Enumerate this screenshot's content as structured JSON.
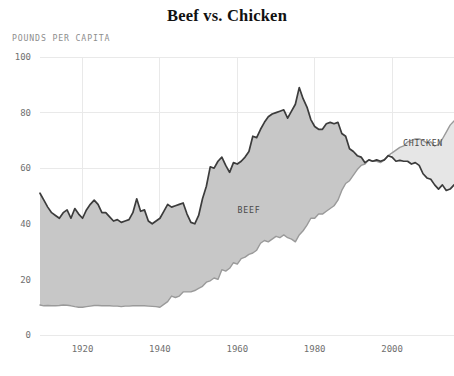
{
  "chart_data": {
    "type": "area",
    "title": "Beef vs. Chicken",
    "subtitle": "",
    "xlabel": "",
    "ylabel": "POUNDS PER CAPITA",
    "ylim": [
      0,
      100
    ],
    "xlim": [
      1909,
      2016
    ],
    "grid": true,
    "legend_position": "inline-annotation",
    "y_ticks": [
      0,
      20,
      40,
      60,
      80,
      100
    ],
    "y_tick_labels": [
      "0",
      "20",
      "40",
      "60",
      "80",
      "100"
    ],
    "x_ticks": [
      1920,
      1940,
      1960,
      1980,
      2000
    ],
    "x_tick_labels": [
      "1920",
      "1940",
      "1960",
      "1980",
      "2000"
    ],
    "annotations": [
      {
        "text": "BEEF",
        "x": 1963,
        "y": 44,
        "color": "#4a4a4a"
      },
      {
        "text": "CHICKEN",
        "x": 2008,
        "y": 68,
        "color": "#4a4a4a"
      }
    ],
    "colors": {
      "beef_fill": "#c7c7c7",
      "beef_stroke": "#3c3c3c",
      "chicken_fill": "#e6e6e6",
      "chicken_stroke": "#9a9a9a",
      "gridline": "#e9e9e9",
      "axis_text": "#6f6f6f",
      "caption_text": "#8d8d8d",
      "title_text": "#111111",
      "background": "#ffffff"
    },
    "x": [
      1909,
      1910,
      1911,
      1912,
      1913,
      1914,
      1915,
      1916,
      1917,
      1918,
      1919,
      1920,
      1921,
      1922,
      1923,
      1924,
      1925,
      1926,
      1927,
      1928,
      1929,
      1930,
      1931,
      1932,
      1933,
      1934,
      1935,
      1936,
      1937,
      1938,
      1939,
      1940,
      1941,
      1942,
      1943,
      1944,
      1945,
      1946,
      1947,
      1948,
      1949,
      1950,
      1951,
      1952,
      1953,
      1954,
      1955,
      1956,
      1957,
      1958,
      1959,
      1960,
      1961,
      1962,
      1963,
      1964,
      1965,
      1966,
      1967,
      1968,
      1969,
      1970,
      1971,
      1972,
      1973,
      1974,
      1975,
      1976,
      1977,
      1978,
      1979,
      1980,
      1981,
      1982,
      1983,
      1984,
      1985,
      1986,
      1987,
      1988,
      1989,
      1990,
      1991,
      1992,
      1993,
      1994,
      1995,
      1996,
      1997,
      1998,
      1999,
      2000,
      2001,
      2002,
      2003,
      2004,
      2005,
      2006,
      2007,
      2008,
      2009,
      2010,
      2011,
      2012,
      2013,
      2014,
      2015,
      2016
    ],
    "series": [
      {
        "name": "BEEF",
        "label": "BEEF",
        "fill": "#c7c7c7",
        "stroke": "#3c3c3c",
        "values": [
          51.0,
          48.5,
          46.0,
          44.0,
          43.0,
          42.0,
          44.0,
          45.0,
          42.0,
          45.5,
          43.5,
          42.0,
          45.0,
          47.0,
          48.5,
          47.0,
          44.0,
          44.0,
          42.5,
          41.0,
          41.5,
          40.5,
          41.0,
          41.5,
          44.0,
          49.0,
          44.5,
          45.0,
          41.0,
          40.0,
          41.0,
          42.0,
          44.5,
          47.0,
          46.0,
          46.5,
          47.0,
          47.5,
          43.5,
          40.5,
          40.0,
          43.0,
          49.0,
          53.5,
          60.5,
          60.0,
          62.5,
          64.0,
          61.0,
          58.5,
          62.0,
          61.5,
          62.5,
          64.0,
          66.0,
          71.5,
          71.0,
          74.0,
          76.5,
          78.5,
          79.5,
          80.0,
          80.5,
          81.0,
          78.0,
          80.5,
          83.0,
          89.0,
          85.0,
          82.0,
          77.5,
          75.0,
          74.0,
          74.0,
          76.0,
          76.5,
          76.0,
          76.5,
          72.5,
          71.5,
          67.0,
          66.0,
          64.5,
          64.0,
          62.0,
          63.0,
          62.5,
          63.0,
          62.5,
          63.0,
          64.5,
          64.0,
          62.5,
          62.8,
          62.5,
          62.5,
          61.5,
          62.0,
          61.0,
          58.0,
          56.5,
          56.0,
          54.0,
          52.5,
          54.0,
          52.0,
          52.5,
          54.0
        ]
      },
      {
        "name": "CHICKEN",
        "label": "CHICKEN",
        "fill": "#e6e6e6",
        "stroke": "#9a9a9a",
        "values": [
          10.8,
          10.5,
          10.6,
          10.5,
          10.5,
          10.6,
          10.8,
          10.7,
          10.5,
          10.2,
          10.0,
          10.0,
          10.2,
          10.4,
          10.6,
          10.6,
          10.5,
          10.5,
          10.5,
          10.4,
          10.4,
          10.2,
          10.4,
          10.4,
          10.5,
          10.5,
          10.5,
          10.5,
          10.4,
          10.3,
          10.2,
          10.0,
          11.0,
          12.0,
          14.0,
          13.5,
          14.0,
          15.5,
          15.5,
          15.5,
          16.0,
          16.8,
          17.5,
          19.0,
          19.5,
          20.5,
          20.0,
          23.5,
          23.0,
          24.0,
          26.0,
          25.5,
          27.5,
          28.0,
          29.0,
          29.5,
          30.5,
          33.0,
          34.0,
          33.5,
          34.5,
          35.5,
          35.0,
          36.0,
          35.0,
          34.5,
          33.5,
          36.0,
          37.5,
          39.5,
          42.0,
          42.0,
          43.5,
          43.5,
          44.5,
          45.5,
          46.5,
          48.5,
          52.0,
          54.5,
          55.5,
          57.5,
          59.5,
          61.0,
          61.5,
          63.0,
          62.5,
          62.5,
          62.0,
          63.0,
          64.5,
          65.5,
          66.5,
          67.5,
          68.0,
          69.5,
          70.0,
          70.5,
          70.5,
          70.0,
          69.0,
          69.5,
          68.0,
          68.5,
          70.5,
          73.0,
          75.5,
          77.0
        ]
      }
    ]
  }
}
